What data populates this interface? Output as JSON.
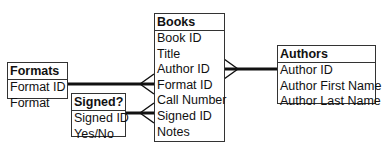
{
  "entities": {
    "books": {
      "title": "Books",
      "fields": [
        "Book ID",
        "Title",
        "Author ID",
        "Format ID",
        "Call Number",
        "Signed ID",
        "Notes"
      ]
    },
    "formats": {
      "title": "Formats",
      "fields": [
        "Format ID",
        "Format"
      ]
    },
    "signed": {
      "title": "Signed?",
      "fields": [
        "Signed ID",
        "Yes/No"
      ]
    },
    "authors": {
      "title": "Authors",
      "fields": [
        "Author ID",
        "Author First Name",
        "Author Last Name"
      ]
    }
  },
  "relationships": [
    {
      "from": "Formats.Format ID",
      "to": "Books.Format ID",
      "type": "one-to-many"
    },
    {
      "from": "Signed?.Signed ID",
      "to": "Books.Signed ID",
      "type": "one-to-many"
    },
    {
      "from": "Authors.Author ID",
      "to": "Books.Author ID",
      "type": "one-to-many"
    }
  ]
}
